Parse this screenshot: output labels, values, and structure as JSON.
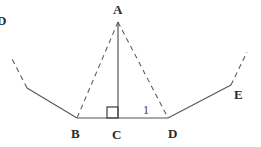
{
  "figure": {
    "type": "geometry-diagram",
    "background_color": "#ffffff",
    "stroke_color": "#55555a",
    "dashed_stroke_color": "#5a5a5f",
    "labels": {
      "apex": "A",
      "left_base": "B",
      "foot": "C",
      "right_base": "D",
      "right_outer": "E",
      "left_clipped": "D",
      "segment_mark": "1"
    },
    "points": {
      "A": {
        "x": 118,
        "y": 22
      },
      "B": {
        "x": 77,
        "y": 118
      },
      "C": {
        "x": 118,
        "y": 118
      },
      "D": {
        "x": 168,
        "y": 118
      },
      "E": {
        "x": 231,
        "y": 85
      },
      "left_bend": {
        "x": 27,
        "y": 88
      },
      "left_dash_end": {
        "x": 11,
        "y": 57
      },
      "right_dash_end": {
        "x": 247,
        "y": 52
      }
    },
    "right_angle": {
      "at": "C",
      "size": 11,
      "marker": "square"
    },
    "segments": [
      {
        "name": "AC",
        "from": "A",
        "to": "C",
        "style": "solid",
        "label": "altitude"
      },
      {
        "name": "AB",
        "from": "A",
        "to": "B",
        "style": "dashed",
        "label": "left-leg"
      },
      {
        "name": "AD",
        "from": "A",
        "to": "D",
        "style": "dashed",
        "label": "right-leg"
      },
      {
        "name": "BD",
        "from": "B",
        "to": "D",
        "style": "solid",
        "label": "base"
      },
      {
        "name": "B-left-bend",
        "from": "B",
        "to": "left_bend",
        "style": "solid",
        "label": "left-slope"
      },
      {
        "name": "left-bend-extension",
        "from": "left_bend",
        "to": "left_dash_end",
        "style": "dashed",
        "label": "left-extension"
      },
      {
        "name": "D-E",
        "from": "D",
        "to": "E",
        "style": "solid",
        "label": "right-slope"
      },
      {
        "name": "E-extension",
        "from": "E",
        "to": "right_dash_end",
        "style": "dashed",
        "label": "right-extension"
      }
    ]
  }
}
